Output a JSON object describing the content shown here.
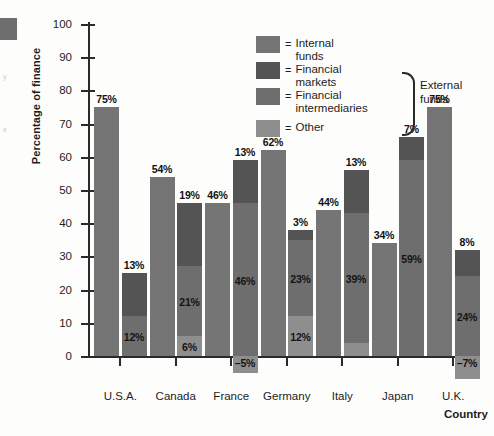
{
  "chart_data": {
    "type": "bar",
    "title": "",
    "xlabel": "Country",
    "ylabel": "Percentage of finance",
    "ylim": [
      0,
      100
    ],
    "yticks": [
      0,
      10,
      20,
      30,
      40,
      50,
      60,
      70,
      80,
      90,
      100
    ],
    "grid": false,
    "legend_position": "top-right",
    "categories": [
      "U.S.A.",
      "Canada",
      "France",
      "Germany",
      "Italy",
      "Japan",
      "U.K."
    ],
    "series": [
      {
        "name": "Internal funds",
        "color": "#757575",
        "values": [
          75,
          54,
          46,
          62,
          44,
          34,
          75
        ]
      },
      {
        "name": "Other",
        "color": "#8e8e8e",
        "values": [
          null,
          6,
          -5,
          12,
          4,
          null,
          -7
        ]
      },
      {
        "name": "Financial intermediaries",
        "color": "#6e6e6e",
        "values": [
          12,
          21,
          46,
          23,
          39,
          59,
          24
        ]
      },
      {
        "name": "Financial markets",
        "color": "#545454",
        "values": [
          13,
          19,
          13,
          3,
          13,
          7,
          8
        ]
      }
    ],
    "groups": [
      {
        "category": "U.S.A.",
        "internal": {
          "label": "75%",
          "value": 75
        },
        "external_stack": [
          {
            "series": "Financial intermediaries",
            "label": "12%",
            "value": 12
          },
          {
            "series": "Financial markets",
            "label": "13%",
            "value": 13
          }
        ],
        "negative": null
      },
      {
        "category": "Canada",
        "internal": {
          "label": "54%",
          "value": 54
        },
        "external_stack": [
          {
            "series": "Other",
            "label": "6%",
            "value": 6
          },
          {
            "series": "Financial intermediaries",
            "label": "21%",
            "value": 21
          },
          {
            "series": "Financial markets",
            "label": "19%",
            "value": 19
          }
        ],
        "negative": null
      },
      {
        "category": "France",
        "internal": {
          "label": "46%",
          "value": 46
        },
        "external_stack": [
          {
            "series": "Financial intermediaries",
            "label": "46%",
            "value": 46
          },
          {
            "series": "Financial markets",
            "label": "13%",
            "value": 13
          }
        ],
        "negative": {
          "series": "Other",
          "label": "–5%",
          "value": -5
        }
      },
      {
        "category": "Germany",
        "internal": {
          "label": "62%",
          "value": 62
        },
        "external_stack": [
          {
            "series": "Other",
            "label": "12%",
            "value": 12
          },
          {
            "series": "Financial intermediaries",
            "label": "23%",
            "value": 23
          },
          {
            "series": "Financial markets",
            "label": "3%",
            "value": 3
          }
        ],
        "negative": null
      },
      {
        "category": "Italy",
        "internal": {
          "label": "44%",
          "value": 44
        },
        "external_stack": [
          {
            "series": "Other",
            "label": "4%",
            "value": 4
          },
          {
            "series": "Financial intermediaries",
            "label": "39%",
            "value": 39
          },
          {
            "series": "Financial markets",
            "label": "13%",
            "value": 13
          }
        ],
        "negative": null
      },
      {
        "category": "Japan",
        "internal": {
          "label": "34%",
          "value": 34
        },
        "external_stack": [
          {
            "series": "Financial intermediaries",
            "label": "59%",
            "value": 59
          },
          {
            "series": "Financial markets",
            "label": "7%",
            "value": 7
          }
        ],
        "negative": null
      },
      {
        "category": "U.K.",
        "internal": {
          "label": "75%",
          "value": 75
        },
        "external_stack": [
          {
            "series": "Financial intermediaries",
            "label": "24%",
            "value": 24
          },
          {
            "series": "Financial markets",
            "label": "8%",
            "value": 8
          }
        ],
        "negative": {
          "series": "Other",
          "label": "–7%",
          "value": -7
        }
      }
    ]
  },
  "legend": {
    "items": [
      {
        "equals": "=",
        "label": "Internal funds",
        "color": "#757575"
      },
      {
        "equals": "=",
        "label": "Financial markets",
        "color": "#545454"
      },
      {
        "equals": "=",
        "label": "Financial\nintermediaries",
        "color": "#6e6e6e"
      },
      {
        "equals": "=",
        "label": "Other",
        "color": "#8e8e8e"
      }
    ],
    "group_label": "External\nfunds"
  }
}
